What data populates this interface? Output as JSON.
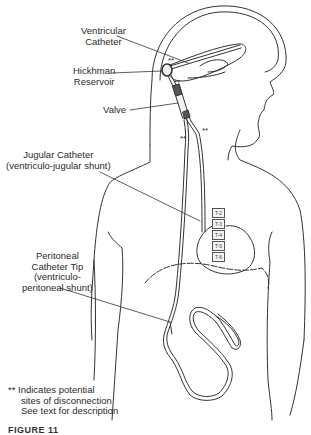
{
  "figure": {
    "labels": {
      "ventricular_catheter": [
        "Ventricular",
        "Catheter"
      ],
      "hickman_reservoir": [
        "Hickhman",
        "Reservoir"
      ],
      "valve": "Valve",
      "jugular_catheter": [
        "Jugular Catheter",
        "(ventriculo-jugular shunt)"
      ],
      "peritoneal_catheter": [
        "Peritoneal",
        "Catheter Tip",
        "(ventriculo-",
        "peritoneal shunt)"
      ],
      "footnote": [
        "** Indicates potential",
        "sites of disconnection",
        "See text for description"
      ]
    },
    "vertebra_labels": [
      "T-2",
      "T-3",
      "T-4",
      "T-5",
      "T-6"
    ],
    "disconnection_marker": "**",
    "caption": "FIGURE 11"
  }
}
